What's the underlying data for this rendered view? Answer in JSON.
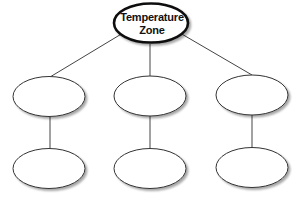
{
  "diagram": {
    "type": "concept-map",
    "root": {
      "label_line1": "Temperature",
      "label_line2": "Zone"
    },
    "branches": [
      {
        "level1": "",
        "level2": ""
      },
      {
        "level1": "",
        "level2": ""
      },
      {
        "level1": "",
        "level2": ""
      }
    ],
    "colors": {
      "stroke": "#333333",
      "fill": "#ffffff",
      "shadow": "#bbbbbb"
    }
  }
}
